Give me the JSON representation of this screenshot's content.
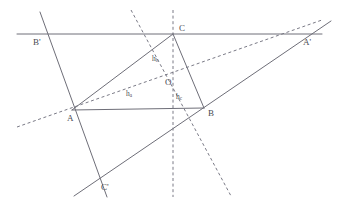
{
  "figure": {
    "type": "euclidean-geometry-diagram",
    "background_color": "#ffffff",
    "solid_stroke_color": "#6e6e78",
    "dashed_stroke_color": "#7a7a86",
    "label_color": "#4a4a52",
    "stroke_width": 1.0
  },
  "labels": {
    "A": "A",
    "B": "B",
    "C": "C",
    "A_prime": "A'",
    "B_prime": "B'",
    "C_prime": "C'",
    "O": "O",
    "h_a_main": "h",
    "h_a_sub": "a",
    "h_b_main": "h",
    "h_b_sub": "b",
    "h_c_main": "h",
    "h_c_sub": "c"
  },
  "points": {
    "A": {
      "x": 72,
      "y": 110,
      "label_x": 67,
      "label_y": 121
    },
    "B": {
      "x": 204,
      "y": 108,
      "label_x": 208,
      "label_y": 116
    },
    "C": {
      "x": 173,
      "y": 34,
      "label_x": 179,
      "label_y": 31
    },
    "O": {
      "x": 172,
      "y": 76,
      "label_x": 165,
      "label_y": 85
    },
    "A_prime": {
      "x": 305,
      "y": 34,
      "label_x": 303,
      "label_y": 45
    },
    "B_prime": {
      "x": 55,
      "y": 34,
      "label_x": 33,
      "label_y": 45
    },
    "C_prime": {
      "x": 96,
      "y": 185,
      "label_x": 101,
      "label_y": 190
    }
  },
  "label_positions": {
    "h_a": {
      "x": 126,
      "y": 96
    },
    "h_b": {
      "x": 152,
      "y": 61
    },
    "h_c": {
      "x": 176,
      "y": 99
    }
  },
  "solid_segments": [
    {
      "name": "side-AB",
      "x1": 72,
      "y1": 110,
      "x2": 204,
      "y2": 108
    },
    {
      "name": "side-BC",
      "x1": 204,
      "y1": 108,
      "x2": 173,
      "y2": 34
    },
    {
      "name": "side-CA",
      "x1": 173,
      "y1": 34,
      "x2": 72,
      "y2": 110
    },
    {
      "name": "line-B-prime-A-prime",
      "x1": 17,
      "y1": 34,
      "x2": 322,
      "y2": 34
    },
    {
      "name": "line-B-prime-C-prime",
      "x1": 40,
      "y1": 12,
      "x2": 107,
      "y2": 197
    },
    {
      "name": "line-C-prime-A-prime",
      "x1": 74,
      "y1": 196,
      "x2": 331,
      "y2": 21
    }
  ],
  "dashed_segments": [
    {
      "name": "altitude-h-a",
      "x1": 17,
      "y1": 127,
      "x2": 322,
      "y2": 20
    },
    {
      "name": "altitude-h-b",
      "x1": 131,
      "y1": 10,
      "x2": 231,
      "y2": 196
    },
    {
      "name": "altitude-h-c",
      "x1": 173,
      "y1": 10,
      "x2": 173,
      "y2": 197
    }
  ],
  "annotations": {
    "orthocenter_note": "O is the common intersection point of the three altitudes",
    "altitude_names": [
      "h_a",
      "h_b",
      "h_c"
    ],
    "triangle_vertices": [
      "A",
      "B",
      "C"
    ],
    "anticomplementary_vertices": [
      "A'",
      "B'",
      "C'"
    ]
  }
}
